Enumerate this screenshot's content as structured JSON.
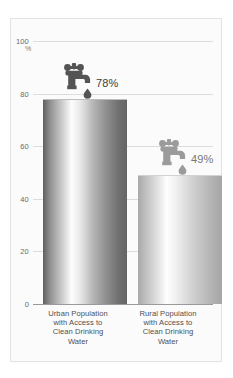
{
  "chart_data": {
    "type": "bar",
    "title": "",
    "subtitle": "",
    "xlabel": "",
    "ylabel": "%",
    "unit_label": "%",
    "ylim": [
      0,
      100
    ],
    "yticks": [
      100,
      80,
      60,
      40,
      20,
      0
    ],
    "ytick_labels": [
      "100",
      "80",
      "60",
      "40",
      "20",
      "0"
    ],
    "grid": true,
    "legend": "none",
    "categories": [
      "Urban Population with Access to Clean Drinking Water",
      "Rural Population with Access to Clean Drinking Water"
    ],
    "values": [
      78,
      49
    ],
    "data_labels": [
      "78%",
      "49%"
    ],
    "annotations": [
      "faucet-icon with water drop above each bar"
    ]
  },
  "axis": {
    "unit": "%",
    "ticks": [
      {
        "value": 100,
        "label": "100"
      },
      {
        "value": 80,
        "label": "80"
      },
      {
        "value": 60,
        "label": "60"
      },
      {
        "value": 40,
        "label": "40"
      },
      {
        "value": 20,
        "label": "20"
      },
      {
        "value": 0,
        "label": "0"
      }
    ]
  },
  "bars": [
    {
      "key": "urban",
      "value": 78,
      "data_label": "78%",
      "label_lines": [
        "Urban Population",
        "with Access to",
        "Clean Drinking",
        "Water"
      ],
      "icon": "faucet-icon",
      "icon_color": "#545454",
      "label_color": "#3e3e3e"
    },
    {
      "key": "rural",
      "value": 49,
      "data_label": "49%",
      "label_lines": [
        "Rural Population",
        "with Access to",
        "Clean Drinking",
        "Water"
      ],
      "icon": "faucet-icon",
      "icon_color": "#9b9b9b",
      "label_color": "#777777"
    }
  ],
  "colors": {
    "background": "#ffffff",
    "panel": "#fbfbfb",
    "panel_border": "#e3e3e3",
    "gridline": "#dcdcdc",
    "baseline": "#9a9a9a",
    "tick_text": "#6a6a6a",
    "category_text": "#4f4f4f",
    "bar_urban_dark": "#5f5f5f",
    "bar_urban_light": "#fdfdfd",
    "bar_rural_dark": "#a6a6a6",
    "bar_rural_light": "#fefefe",
    "faucet_urban": "#545454",
    "faucet_rural": "#9b9b9b"
  }
}
